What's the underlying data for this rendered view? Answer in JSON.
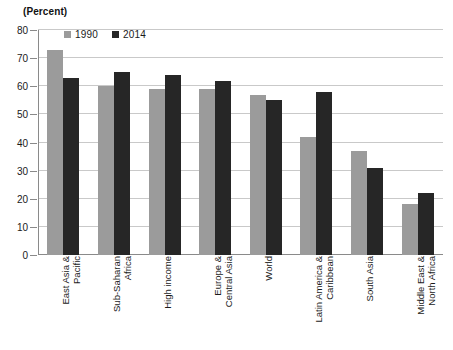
{
  "chart_data": {
    "type": "bar",
    "title": "",
    "subtitle": "",
    "unit_label": "(Percent)",
    "xlabel": "",
    "ylabel": "",
    "ylim": [
      0,
      80
    ],
    "ytick_step": 10,
    "yticks": [
      0,
      10,
      20,
      30,
      40,
      50,
      60,
      70,
      80
    ],
    "ytick_labels": [
      "0",
      "10",
      "20",
      "30",
      "40",
      "50",
      "60",
      "70",
      "80"
    ],
    "grid": true,
    "legend_position": "top-left",
    "categories": [
      "East Asia & Pacific",
      "Sub-Saharan Africa",
      "High income",
      "Europe & Central Asia",
      "World",
      "Latin America & Caribbean",
      "South Asia",
      "Middle East & North Africa"
    ],
    "category_lines": [
      [
        "East Asia &",
        "Pacific"
      ],
      [
        "Sub-Saharan",
        "Africa"
      ],
      [
        "High income",
        ""
      ],
      [
        "Europe &",
        "Central Asia"
      ],
      [
        "World",
        ""
      ],
      [
        "Latin America &",
        "Caribbean"
      ],
      [
        "South Asia",
        ""
      ],
      [
        "Middle East &",
        "North Africa"
      ]
    ],
    "series": [
      {
        "name": "1990",
        "color": "#9b9b9b",
        "values": [
          73,
          60,
          59,
          59,
          57,
          42,
          37,
          18
        ]
      },
      {
        "name": "2014",
        "color": "#262626",
        "values": [
          63,
          65,
          64,
          62,
          55,
          58,
          31,
          22
        ]
      }
    ]
  },
  "legend": {
    "items": [
      {
        "label": "1990",
        "color": "#9b9b9b"
      },
      {
        "label": "2014",
        "color": "#262626"
      }
    ]
  },
  "colors": {
    "series_1990": "#9b9b9b",
    "series_2014": "#262626",
    "gridline": "#c9c9c9",
    "axis": "#8a8a8a",
    "text": "#1a1a1a",
    "background": "#ffffff"
  }
}
